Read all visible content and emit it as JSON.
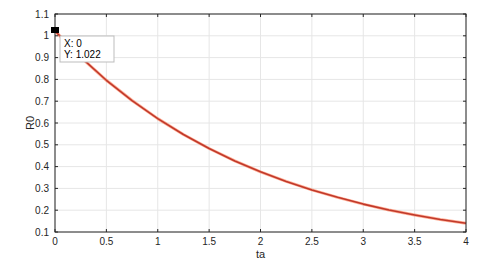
{
  "chart_data": {
    "type": "line",
    "title": "",
    "xlabel": "ta",
    "ylabel": "R0",
    "xlim": [
      0,
      4
    ],
    "ylim": [
      0.1,
      1.1
    ],
    "grid": true,
    "legend": null,
    "xticks": [
      0,
      0.5,
      1,
      1.5,
      2,
      2.5,
      3,
      3.5,
      4
    ],
    "xtick_labels": [
      "0",
      "0.5",
      "1",
      "1.5",
      "2",
      "2.5",
      "3",
      "3.5",
      "4"
    ],
    "yticks": [
      0.1,
      0.2,
      0.3,
      0.4,
      0.5,
      0.6,
      0.7,
      0.8,
      0.9,
      1,
      1.1
    ],
    "ytick_labels": [
      "0.1",
      "0.2",
      "0.3",
      "0.4",
      "0.5",
      "0.6",
      "0.7",
      "0.8",
      "0.9",
      "1",
      "1.1"
    ],
    "series": [
      {
        "name": "R0",
        "color": "#c0392b",
        "x": [
          0,
          0.25,
          0.5,
          0.75,
          1,
          1.25,
          1.5,
          1.75,
          2,
          2.25,
          2.5,
          2.75,
          3,
          3.25,
          3.5,
          3.75,
          4
        ],
        "y": [
          1.022,
          0.902,
          0.796,
          0.703,
          0.62,
          0.547,
          0.483,
          0.426,
          0.376,
          0.332,
          0.293,
          0.259,
          0.228,
          0.201,
          0.178,
          0.157,
          0.14
        ]
      }
    ],
    "annotations": [
      {
        "type": "datatip",
        "x": 0,
        "y": 1.022,
        "lines": [
          "X: 0",
          "Y: 1.022"
        ]
      }
    ]
  },
  "datatip": {
    "x_label": "X: 0",
    "y_label": "Y: 1.022"
  },
  "colors": {
    "line": "#c0392b",
    "line_edge": "#ff6a3d",
    "axis": "#262626",
    "grid": "#e6e6e6"
  }
}
